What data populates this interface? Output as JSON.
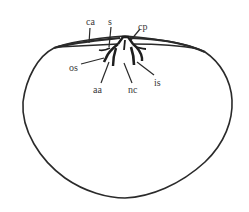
{
  "figure": {
    "type": "line-drawing",
    "stroke_color": "#2a2a2a",
    "background": "#ffffff",
    "labels": [
      {
        "id": "ca",
        "text": "ca",
        "x": 86,
        "y": 17
      },
      {
        "id": "s",
        "text": "s",
        "x": 108,
        "y": 17
      },
      {
        "id": "cp",
        "text": "cp",
        "x": 138,
        "y": 22
      },
      {
        "id": "os",
        "text": "os",
        "x": 69,
        "y": 63
      },
      {
        "id": "aa",
        "text": "aa",
        "x": 93,
        "y": 85
      },
      {
        "id": "nc",
        "text": "nc",
        "x": 128,
        "y": 85
      },
      {
        "id": "is",
        "text": "is",
        "x": 154,
        "y": 78
      }
    ]
  }
}
